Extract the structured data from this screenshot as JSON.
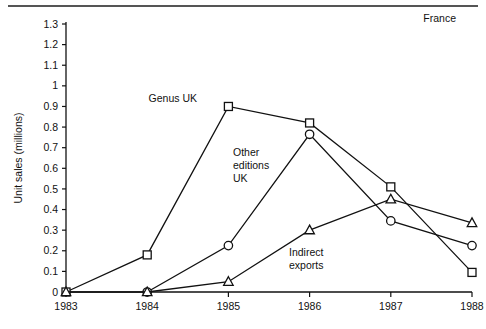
{
  "corner_note": "France",
  "chart_data": {
    "type": "line",
    "title": "",
    "subtitle": "",
    "xlabel": "",
    "ylabel": "Unit sales (millions)",
    "annotation": "France",
    "categories": [
      "1983",
      "1984",
      "1985",
      "1986",
      "1987",
      "1988"
    ],
    "x": [
      1983,
      1984,
      1985,
      1986,
      1987,
      1988
    ],
    "xlim": [
      1983,
      1988
    ],
    "ylim": [
      0,
      1.3
    ],
    "ytick_labels": [
      "0",
      "0.1",
      "0.2",
      "0.3",
      "0.4",
      "0.5",
      "0.6",
      "0.7",
      "0.8",
      "0.9",
      "1",
      "1.1",
      "1.2",
      "1.3"
    ],
    "ytick_values": [
      0,
      0.1,
      0.2,
      0.3,
      0.4,
      0.5,
      0.6,
      0.7,
      0.8,
      0.9,
      1.0,
      1.1,
      1.2,
      1.3
    ],
    "xtick_labels": [
      "1983",
      "1984",
      "1985",
      "1986",
      "1987",
      "1988"
    ],
    "grid": false,
    "legend": "inline-labels",
    "series": [
      {
        "name": "Genus UK",
        "marker": "square",
        "label_anchor_year": 1985,
        "x": [
          1983,
          1984,
          1985,
          1986,
          1987,
          1988
        ],
        "values": [
          0,
          0.18,
          0.9,
          0.82,
          0.51,
          0.095
        ]
      },
      {
        "name": "Other editions UK",
        "marker": "circle",
        "label_anchor_year": 1986,
        "x": [
          1984,
          1985,
          1986,
          1987,
          1988
        ],
        "values": [
          0,
          0.225,
          0.765,
          0.345,
          0.225
        ]
      },
      {
        "name": "Indirect exports",
        "marker": "triangle",
        "label_anchor_year": 1986,
        "x": [
          1983,
          1984,
          1985,
          1986,
          1987,
          1988
        ],
        "values": [
          0,
          0,
          0.05,
          0.3,
          0.45,
          0.335
        ]
      }
    ],
    "series_label_lines": {
      "genus_uk": [
        "Genus UK"
      ],
      "other_editions_uk": [
        "Other",
        "editions",
        "UK"
      ],
      "indirect_exports": [
        "Indirect",
        "exports"
      ]
    },
    "colors": {
      "axis": "#111111",
      "line": "#111111",
      "marker_fill": "#ffffff",
      "background": "#ffffff"
    }
  }
}
